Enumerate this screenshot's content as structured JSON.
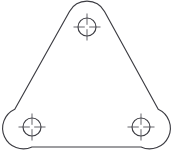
{
  "drawing": {
    "title": "Triangular plate with three holes",
    "view": "front-view",
    "canvas": {
      "width": 174,
      "height": 161,
      "background": "#ffffff"
    },
    "style": {
      "outline_color": "#3c3c42",
      "outline_width": 1.15,
      "hole_color": "#3c3c42",
      "centerline_color": "#4a4a50",
      "centerline_width": 0.85
    },
    "outline": {
      "name": "rounded-triangle-plate",
      "corner_radius": 20,
      "vertices": [
        {
          "label": "top",
          "x": 87,
          "y": 27
        },
        {
          "label": "bottom-left",
          "x": 32,
          "y": 127
        },
        {
          "label": "bottom-right",
          "x": 141,
          "y": 127
        }
      ],
      "bounds": {
        "left": 12,
        "top": 10,
        "right": 162,
        "bottom": 146
      },
      "path": "M 69.48 11.53 A 20 20 0 0 1 104.52 11.53 L 158.21 109.21 A 20 20 0 0 1 141 147 L 32 147 A 20 20 0 0 1 14.79 109.21 Z"
    },
    "holes": [
      {
        "name": "hole-top",
        "cx": 87,
        "cy": 27,
        "r": 9,
        "center_mark": {
          "extend": 4.5,
          "gap": 2.2
        }
      },
      {
        "name": "hole-bottom-left",
        "cx": 32,
        "cy": 127,
        "r": 9,
        "center_mark": {
          "extend": 4.5,
          "gap": 2.2
        }
      },
      {
        "name": "hole-bottom-right",
        "cx": 141,
        "cy": 127,
        "r": 9,
        "center_mark": {
          "extend": 4.5,
          "gap": 2.2
        }
      }
    ]
  },
  "chart_data": {
    "type": "diagram",
    "shape": "rounded equilateral triangle",
    "hole_count": 3,
    "hole_radius": 9,
    "corner_radius": 20,
    "hole_centers": [
      [
        87,
        27
      ],
      [
        32,
        127
      ],
      [
        141,
        127
      ]
    ],
    "annotations": []
  }
}
